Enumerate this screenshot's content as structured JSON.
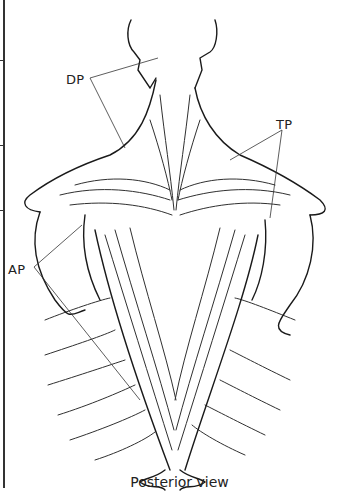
{
  "figure": {
    "caption": "Posterior view",
    "labels": {
      "dp": "DP",
      "tp": "TP",
      "ap": "AP"
    },
    "colors": {
      "line": "#1a1a1a",
      "leader": "#333333",
      "background": "#ffffff"
    }
  }
}
